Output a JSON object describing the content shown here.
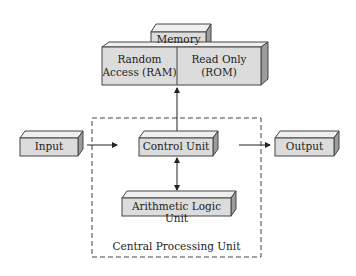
{
  "diagram": {
    "memory": {
      "title": "Memory",
      "ram": "Random Access (RAM)",
      "ram_line1": "Random",
      "ram_line2": "Access (RAM)",
      "rom_line1": "Read Only",
      "rom_line2": "(ROM)"
    },
    "input": "Input",
    "output": "Output",
    "control_unit": "Control Unit",
    "alu": "Arithmetic Logic Unit",
    "cpu_label": "Central Processing Unit"
  }
}
